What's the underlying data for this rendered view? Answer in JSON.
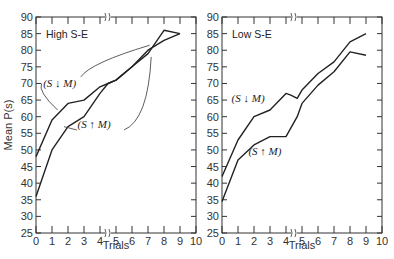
{
  "chart_data": [
    {
      "type": "line",
      "title": "High S-E",
      "xlabel": "Trials",
      "ylabel": "Mean P(s)",
      "xlim": [
        0,
        10
      ],
      "ylim": [
        25,
        90
      ],
      "xticks": [
        0,
        1,
        2,
        3,
        4,
        5,
        6,
        7,
        8,
        9,
        10
      ],
      "yticks": [
        25,
        30,
        35,
        40,
        45,
        50,
        55,
        60,
        65,
        70,
        75,
        80,
        85,
        90
      ],
      "axis_break_x": 4.5,
      "grid": false,
      "series": [
        {
          "name": "(S ↓ M)",
          "x": [
            0,
            1,
            2,
            3,
            4,
            4.5,
            5,
            6,
            7,
            8,
            9
          ],
          "values": [
            48,
            59,
            64,
            65,
            69,
            70,
            71,
            75,
            79,
            86,
            85
          ]
        },
        {
          "name": "(S ↑ M)",
          "x": [
            0,
            1,
            2,
            3,
            4,
            4.5,
            5,
            6,
            7,
            8,
            9
          ],
          "values": [
            36,
            50,
            57,
            60,
            67,
            70,
            71,
            75,
            80,
            83,
            85
          ]
        }
      ]
    },
    {
      "type": "line",
      "title": "Low S-E",
      "xlabel": "Trials",
      "ylabel": "",
      "xlim": [
        0,
        10
      ],
      "ylim": [
        25,
        90
      ],
      "xticks": [
        0,
        1,
        2,
        3,
        4,
        5,
        6,
        7,
        8,
        9,
        10
      ],
      "yticks": [
        25,
        30,
        35,
        40,
        45,
        50,
        55,
        60,
        65,
        70,
        75,
        80,
        85,
        90
      ],
      "axis_break_x": 4.5,
      "grid": false,
      "series": [
        {
          "name": "(S ↓ M)",
          "x": [
            0,
            1,
            2,
            3,
            4,
            4.3,
            4.7,
            5,
            6,
            7,
            8,
            9
          ],
          "values": [
            42,
            53,
            60,
            62,
            67,
            66.5,
            65.5,
            68,
            73,
            76.5,
            82.5,
            85
          ]
        },
        {
          "name": "(S ↑ M)",
          "x": [
            0,
            1,
            2,
            3,
            4,
            4.7,
            5,
            6,
            7,
            8,
            9
          ],
          "values": [
            34.5,
            47,
            51.5,
            54,
            54,
            60,
            64,
            69.5,
            73.5,
            79.5,
            78.5
          ]
        }
      ]
    }
  ],
  "left_panel": {
    "label": "High S-E",
    "ylabel": "Mean P(s)",
    "xlabel": "Trials",
    "annot_down": "(S ↓ M)",
    "annot_up": "(S ↑ M)"
  },
  "right_panel": {
    "label": "Low S-E",
    "xlabel": "Trials",
    "annot_down": "(S ↓ M)",
    "annot_up": "(S ↑ M)"
  }
}
